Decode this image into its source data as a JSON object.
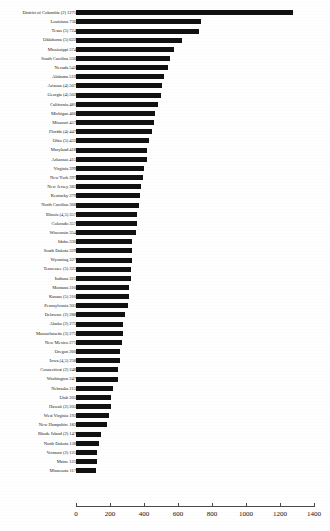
{
  "chart_data": {
    "type": "bar",
    "orientation": "horizontal",
    "title": "",
    "xlabel": "",
    "ylabel": "",
    "xlim": [
      0,
      1400
    ],
    "xticks": [
      "0",
      "200",
      "400",
      "600",
      "800",
      "1000",
      "1200",
      "1400"
    ],
    "grid": false,
    "legend": null,
    "categories": [
      "District of Columbia (2)",
      "Louisiana",
      "Texas (5)",
      "Oklahoma (5)",
      "Mississippi",
      "South Carolina",
      "Nevada",
      "Alabama",
      "Arizona (4)",
      "Georgia (4)",
      "California",
      "Michigan",
      "Missouri",
      "Florida (4)",
      "Ohio (5)",
      "Maryland",
      "Arkansas",
      "Virginia",
      "New York",
      "New Jersey",
      "Kentucky",
      "North Carolina",
      "Illinois (4,5)",
      "Colorado",
      "Wisconsin",
      "Idaho",
      "South Dakota",
      "Wyoming",
      "Tennessee (5)",
      "Indiana",
      "Montana",
      "Kansas (5)",
      "Pennsylvania",
      "Delaware (2)",
      "Alaska (2)",
      "Massachusetts (3)",
      "New Mexico",
      "Oregon",
      "Iowa (4,5)",
      "Connecticut (2)",
      "Washington",
      "Nebraska",
      "Utah",
      "Hawaii (2)",
      "West Virginia",
      "New Hampshire",
      "Rhode Island (2)",
      "North Dakota",
      "Vermont (2)",
      "Maine",
      "Minnesota"
    ],
    "values": [
      1275,
      736,
      724,
      622,
      574,
      550,
      542,
      519,
      507,
      502,
      481,
      466,
      457,
      447,
      432,
      418,
      415,
      399,
      397,
      382,
      379,
      368,
      357,
      357,
      354,
      330,
      329,
      327,
      325,
      321,
      310,
      310,
      303,
      288,
      275,
      275,
      271,
      260,
      258,
      248,
      247,
      215,
      205,
      205,
      192,
      182,
      147,
      138,
      125,
      125,
      117
    ],
    "row_labels": [
      "District of Columbia (2) 1275",
      "Louisiana 736",
      "Texas (5) 724",
      "Oklahoma (5) 622",
      "Mississippi 574",
      "South Carolina 550",
      "Nevada 542",
      "Alabama 519",
      "Arizona (4) 507",
      "Georgia (4) 502",
      "California 481",
      "Michigan 466",
      "Missouri 457",
      "Florida (4) 447",
      "Ohio (5) 432",
      "Maryland 418",
      "Arkansas 415",
      "Virginia 399",
      "New York 397",
      "New Jersey 382",
      "Kentucky 379",
      "North Carolina 368",
      "Illinois (4,5) 357",
      "Colorado 357",
      "Wisconsin 354",
      "Idaho 330",
      "South Dakota 329",
      "Wyoming 327",
      "Tennessee (5) 325",
      "Indiana 321",
      "Montana 310",
      "Kansas (5) 310",
      "Pennsylvania 303",
      "Delaware (2) 288",
      "Alaska (2) 275",
      "Massachusetts (3) 275",
      "New Mexico 271",
      "Oregon 260",
      "Iowa (4,5) 258",
      "Connecticut (2) 248",
      "Washington 247",
      "Nebraska 215",
      "Utah 205",
      "Hawaii (2) 205",
      "West Virginia 192",
      "New Hampshire 182",
      "Rhode Island (2) 147",
      "North Dakota 138",
      "Vermont (2) 125",
      "Maine 125",
      "Minnesota 117"
    ],
    "bar_color": "#111111",
    "background_color": "#ffffff"
  }
}
